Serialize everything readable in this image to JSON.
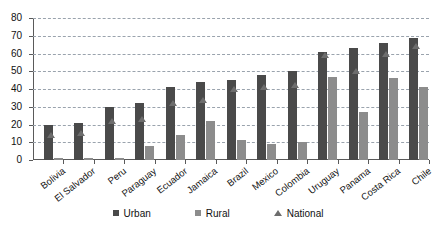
{
  "chart_data": {
    "type": "bar",
    "title": "",
    "subtitle": "",
    "xlabel": "",
    "ylabel": "",
    "ylim": [
      0,
      80
    ],
    "ytick_step": 10,
    "yticks": [
      0,
      10,
      20,
      30,
      40,
      50,
      60,
      70,
      80
    ],
    "grid": true,
    "grid_style": "dashed-horizontal",
    "legend_position": "bottom-center",
    "categories": [
      "Bolivia",
      "El Salvador",
      "Peru",
      "Paraguay",
      "Ecuador",
      "Jamaica",
      "Brazil",
      "Mexico",
      "Colombia",
      "Uruguay",
      "Panama",
      "Costa Rica",
      "Chile"
    ],
    "series": [
      {
        "name": "Urban",
        "marker": "square",
        "color": "#4a4a4a",
        "values": [
          20,
          21,
          30,
          32,
          41,
          44,
          45,
          48,
          50,
          61,
          63,
          66,
          69
        ]
      },
      {
        "name": "Rural",
        "marker": "square",
        "color": "#8c8c8c",
        "values": [
          1,
          1,
          1,
          8,
          14,
          22,
          11,
          9,
          10,
          47,
          27,
          46,
          41
        ]
      },
      {
        "name": "National",
        "marker": "triangle",
        "color": "#6d6d6d",
        "values": [
          14,
          15,
          22,
          23,
          32,
          34,
          40,
          41,
          42,
          59,
          50,
          60,
          64
        ]
      }
    ]
  },
  "legend": {
    "items": [
      {
        "label": "Urban",
        "icon": "square-marker"
      },
      {
        "label": "Rural",
        "icon": "square-marker"
      },
      {
        "label": "National",
        "icon": "triangle-marker"
      }
    ]
  }
}
